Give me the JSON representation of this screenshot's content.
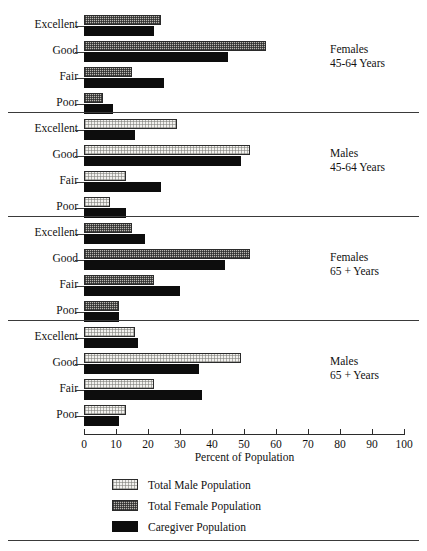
{
  "chart_data": {
    "type": "bar",
    "orientation": "horizontal",
    "title": "",
    "xlabel": "Percent of Population",
    "ylabel": "",
    "xlim": [
      0,
      100
    ],
    "xticks": [
      0,
      10,
      20,
      30,
      40,
      50,
      60,
      70,
      80,
      90,
      100
    ],
    "grid": false,
    "legend_position": "bottom-left",
    "categories": [
      "Excellent",
      "Good",
      "Fair",
      "Poor"
    ],
    "legend": [
      {
        "label": "Total Male Population",
        "key": "total_male",
        "pattern": "light-dotted"
      },
      {
        "label": "Total Female Population",
        "key": "total_female",
        "pattern": "gray-checkered"
      },
      {
        "label": "Caregiver Population",
        "key": "caregiver",
        "pattern": "solid-black"
      }
    ],
    "panels": [
      {
        "caption_line1": "Females",
        "caption_line2": "45-64 Years",
        "series": [
          {
            "name": "Total Female Population",
            "key": "total_female",
            "values": [
              24,
              57,
              15,
              6
            ]
          },
          {
            "name": "Caregiver Population",
            "key": "caregiver",
            "values": [
              22,
              45,
              25,
              9
            ]
          }
        ]
      },
      {
        "caption_line1": "Males",
        "caption_line2": "45-64 Years",
        "series": [
          {
            "name": "Total Male Population",
            "key": "total_male",
            "values": [
              29,
              52,
              13,
              8
            ]
          },
          {
            "name": "Caregiver Population",
            "key": "caregiver",
            "values": [
              16,
              49,
              24,
              13
            ]
          }
        ]
      },
      {
        "caption_line1": "Females",
        "caption_line2": "65 +  Years",
        "series": [
          {
            "name": "Total Female Population",
            "key": "total_female",
            "values": [
              15,
              52,
              22,
              11
            ]
          },
          {
            "name": "Caregiver Population",
            "key": "caregiver",
            "values": [
              19,
              44,
              30,
              11
            ]
          }
        ]
      },
      {
        "caption_line1": "Males",
        "caption_line2": "65 +  Years",
        "series": [
          {
            "name": "Total Male Population",
            "key": "total_male",
            "values": [
              16,
              49,
              22,
              13
            ]
          },
          {
            "name": "Caregiver Population",
            "key": "caregiver",
            "values": [
              17,
              36,
              37,
              11
            ]
          }
        ]
      }
    ]
  },
  "colors": {
    "ink": "#111111",
    "rule": "#3a3a3a",
    "axis": "#2b2b2b",
    "caregiver": "#0d0d0d",
    "female_fill": "#b9b7b1",
    "male_fill": "#f2f1ee"
  }
}
